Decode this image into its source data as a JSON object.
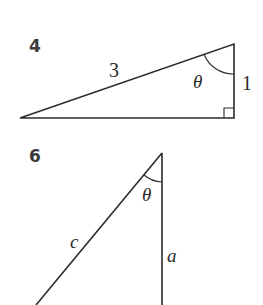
{
  "figures": [
    {
      "number": "4",
      "labels": {
        "hypotenuse": "3",
        "angle": "θ",
        "opposite_side": "1"
      },
      "right_angle_marker": true
    },
    {
      "number": "6",
      "labels": {
        "hypotenuse": "c",
        "angle": "θ",
        "adjacent_side": "a"
      },
      "right_angle_marker": false
    }
  ],
  "colors": {
    "stroke": "#2b2b2b",
    "background": "#ffffff"
  }
}
